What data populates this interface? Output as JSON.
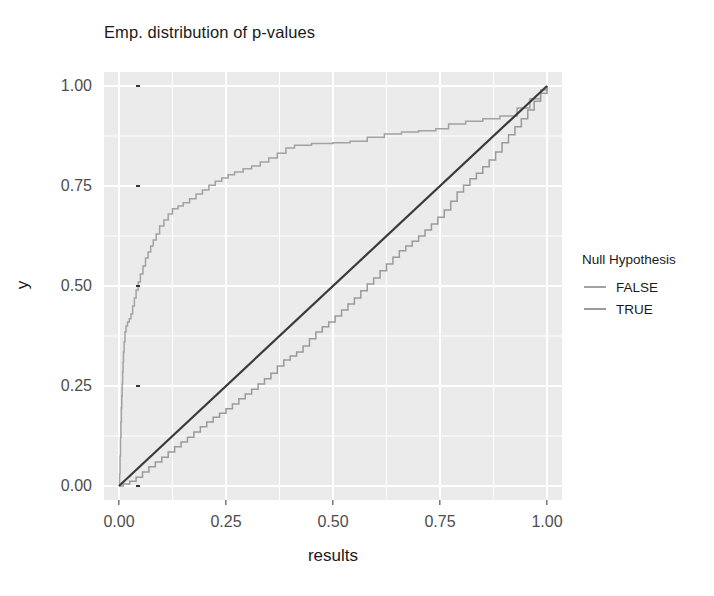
{
  "chart_data": {
    "type": "line",
    "title": "Emp. distribution of p-values",
    "xlabel": "results",
    "ylabel": "y",
    "xlim": [
      -0.035,
      1.035
    ],
    "ylim": [
      -0.035,
      1.035
    ],
    "xticks": [
      "0.00",
      "0.25",
      "0.50",
      "0.75",
      "1.00"
    ],
    "xtick_values": [
      0.0,
      0.25,
      0.5,
      0.75,
      1.0
    ],
    "yticks": [
      "0.00",
      "0.25",
      "0.50",
      "0.75",
      "1.00"
    ],
    "ytick_values": [
      0.0,
      0.25,
      0.5,
      0.75,
      1.0
    ],
    "grid": true,
    "grid_color": "#ffffff",
    "panel_background": "#ebebeb",
    "legend": {
      "position": "right",
      "title": "Null Hypothesis",
      "entries": [
        {
          "label": "FALSE",
          "color": "#a2a2a2"
        },
        {
          "label": "TRUE",
          "color": "#9a9a9a"
        }
      ]
    },
    "annotations": [
      {
        "type": "reference-line",
        "name": "diagonal",
        "from": [
          0,
          0
        ],
        "to": [
          1,
          1
        ],
        "color": "#3a3a3a"
      }
    ],
    "series": [
      {
        "name": "FALSE",
        "style": "step-ecdf",
        "color": "#a2a2a2",
        "points": [
          [
            0.0,
            0.0
          ],
          [
            0.0015,
            0.03
          ],
          [
            0.0025,
            0.075
          ],
          [
            0.0035,
            0.12
          ],
          [
            0.0045,
            0.16
          ],
          [
            0.0055,
            0.195
          ],
          [
            0.0065,
            0.225
          ],
          [
            0.0075,
            0.255
          ],
          [
            0.0085,
            0.285
          ],
          [
            0.0095,
            0.31
          ],
          [
            0.0105,
            0.335
          ],
          [
            0.012,
            0.36
          ],
          [
            0.014,
            0.385
          ],
          [
            0.0165,
            0.4
          ],
          [
            0.02,
            0.41
          ],
          [
            0.024,
            0.418
          ],
          [
            0.028,
            0.43
          ],
          [
            0.032,
            0.45
          ],
          [
            0.036,
            0.47
          ],
          [
            0.04,
            0.49
          ],
          [
            0.045,
            0.51
          ],
          [
            0.05,
            0.53
          ],
          [
            0.056,
            0.55
          ],
          [
            0.062,
            0.57
          ],
          [
            0.068,
            0.585
          ],
          [
            0.074,
            0.6
          ],
          [
            0.08,
            0.615
          ],
          [
            0.087,
            0.63
          ],
          [
            0.095,
            0.65
          ],
          [
            0.105,
            0.665
          ],
          [
            0.115,
            0.68
          ],
          [
            0.125,
            0.693
          ],
          [
            0.138,
            0.7
          ],
          [
            0.15,
            0.708
          ],
          [
            0.165,
            0.718
          ],
          [
            0.18,
            0.73
          ],
          [
            0.195,
            0.74
          ],
          [
            0.21,
            0.752
          ],
          [
            0.225,
            0.762
          ],
          [
            0.24,
            0.77
          ],
          [
            0.255,
            0.778
          ],
          [
            0.27,
            0.785
          ],
          [
            0.29,
            0.793
          ],
          [
            0.31,
            0.8
          ],
          [
            0.33,
            0.81
          ],
          [
            0.35,
            0.82
          ],
          [
            0.37,
            0.832
          ],
          [
            0.39,
            0.845
          ],
          [
            0.41,
            0.852
          ],
          [
            0.45,
            0.856
          ],
          [
            0.5,
            0.858
          ],
          [
            0.54,
            0.862
          ],
          [
            0.58,
            0.872
          ],
          [
            0.62,
            0.88
          ],
          [
            0.66,
            0.885
          ],
          [
            0.7,
            0.888
          ],
          [
            0.74,
            0.893
          ],
          [
            0.77,
            0.905
          ],
          [
            0.81,
            0.912
          ],
          [
            0.85,
            0.918
          ],
          [
            0.89,
            0.925
          ],
          [
            0.93,
            0.945
          ],
          [
            0.96,
            0.968
          ],
          [
            0.985,
            0.99
          ],
          [
            1.0,
            1.0
          ]
        ]
      },
      {
        "name": "TRUE",
        "style": "step-ecdf",
        "color": "#9a9a9a",
        "points": [
          [
            0.0,
            0.0
          ],
          [
            0.01,
            0.005
          ],
          [
            0.025,
            0.012
          ],
          [
            0.04,
            0.022
          ],
          [
            0.055,
            0.035
          ],
          [
            0.07,
            0.048
          ],
          [
            0.085,
            0.06
          ],
          [
            0.1,
            0.072
          ],
          [
            0.115,
            0.085
          ],
          [
            0.13,
            0.098
          ],
          [
            0.145,
            0.11
          ],
          [
            0.16,
            0.122
          ],
          [
            0.175,
            0.135
          ],
          [
            0.19,
            0.148
          ],
          [
            0.205,
            0.16
          ],
          [
            0.22,
            0.172
          ],
          [
            0.235,
            0.182
          ],
          [
            0.25,
            0.193
          ],
          [
            0.265,
            0.205
          ],
          [
            0.28,
            0.218
          ],
          [
            0.295,
            0.23
          ],
          [
            0.31,
            0.242
          ],
          [
            0.325,
            0.255
          ],
          [
            0.34,
            0.268
          ],
          [
            0.355,
            0.282
          ],
          [
            0.37,
            0.3
          ],
          [
            0.385,
            0.315
          ],
          [
            0.4,
            0.325
          ],
          [
            0.415,
            0.335
          ],
          [
            0.43,
            0.35
          ],
          [
            0.445,
            0.368
          ],
          [
            0.46,
            0.385
          ],
          [
            0.475,
            0.398
          ],
          [
            0.49,
            0.41
          ],
          [
            0.505,
            0.425
          ],
          [
            0.52,
            0.44
          ],
          [
            0.535,
            0.455
          ],
          [
            0.55,
            0.47
          ],
          [
            0.565,
            0.488
          ],
          [
            0.58,
            0.505
          ],
          [
            0.595,
            0.52
          ],
          [
            0.61,
            0.538
          ],
          [
            0.625,
            0.555
          ],
          [
            0.64,
            0.572
          ],
          [
            0.655,
            0.588
          ],
          [
            0.67,
            0.6
          ],
          [
            0.685,
            0.612
          ],
          [
            0.7,
            0.625
          ],
          [
            0.715,
            0.64
          ],
          [
            0.73,
            0.655
          ],
          [
            0.745,
            0.672
          ],
          [
            0.76,
            0.69
          ],
          [
            0.775,
            0.712
          ],
          [
            0.79,
            0.735
          ],
          [
            0.805,
            0.752
          ],
          [
            0.82,
            0.768
          ],
          [
            0.835,
            0.782
          ],
          [
            0.85,
            0.798
          ],
          [
            0.865,
            0.815
          ],
          [
            0.88,
            0.835
          ],
          [
            0.895,
            0.858
          ],
          [
            0.91,
            0.878
          ],
          [
            0.925,
            0.898
          ],
          [
            0.94,
            0.918
          ],
          [
            0.955,
            0.94
          ],
          [
            0.97,
            0.962
          ],
          [
            0.985,
            0.982
          ],
          [
            1.0,
            1.0
          ]
        ]
      }
    ]
  }
}
